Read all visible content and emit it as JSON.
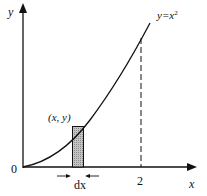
{
  "diagram": {
    "type": "area-under-curve",
    "curve_label": "y=x",
    "curve_exponent": "2",
    "axis_x_label": "x",
    "axis_y_label": "y",
    "origin_label": "0",
    "x_tick_label": "2",
    "point_label": "(x, y)",
    "strip_width_label": "dx",
    "colors": {
      "line": "#111111",
      "strip_fill": "#b8b8b8",
      "background": "#ffffff"
    }
  }
}
